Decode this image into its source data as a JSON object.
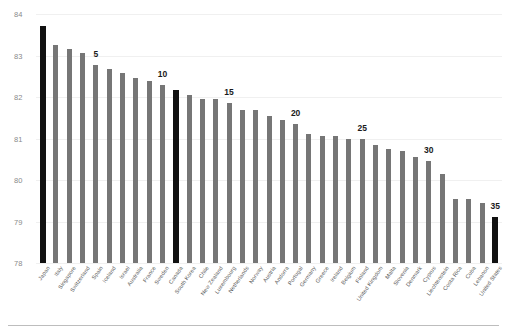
{
  "chart_data": {
    "type": "bar",
    "title": "",
    "subtitle": "",
    "xlabel": "",
    "ylabel": "",
    "ylim": [
      78,
      84
    ],
    "yticks": [
      78,
      79,
      80,
      81,
      82,
      83,
      84
    ],
    "ytick_labels": [
      "78",
      "79",
      "80",
      "81",
      "82",
      "83",
      "84"
    ],
    "grid": true,
    "legend": "none",
    "categories": [
      "Japan",
      "Italy",
      "Singapore",
      "Switzerland",
      "Spain",
      "Iceland",
      "Israel",
      "Australia",
      "France",
      "Sweden",
      "Canada",
      "South Korea",
      "Chile",
      "New Zealand",
      "Luxembourg",
      "Netherlands",
      "Norway",
      "Austria",
      "Andorra",
      "Portugal",
      "Germany",
      "Greece",
      "Ireland",
      "Belgium",
      "Finland",
      "United Kingdom",
      "Malta",
      "Slovenia",
      "Denmark",
      "Cyprus",
      "Liechtenstein",
      "Costa Rica",
      "Cuba",
      "Lebanon",
      "United States"
    ],
    "values": [
      83.7,
      83.25,
      83.15,
      83.05,
      82.77,
      82.67,
      82.58,
      82.47,
      82.38,
      82.28,
      82.17,
      82.05,
      81.95,
      81.95,
      81.85,
      81.68,
      81.68,
      81.55,
      81.45,
      81.35,
      81.1,
      81.05,
      81.05,
      81.0,
      81.0,
      80.85,
      80.75,
      80.7,
      80.55,
      80.45,
      80.15,
      79.55,
      79.55,
      79.45,
      79.1
    ],
    "highlighted": [
      "Japan",
      "Canada",
      "United States"
    ],
    "colors": {
      "bar": "#767676",
      "bar_highlight": "#111111",
      "background": "#ffffff",
      "gridline": "#f0f0f0",
      "tick_text": "#8a8a8a",
      "category_text": "#5b5b5b",
      "rank_text": "#1a1a1a",
      "footer_rule": "#bdbdbd"
    },
    "rank_callouts": [
      {
        "label": "5",
        "category": "Spain"
      },
      {
        "label": "10",
        "category": "Sweden"
      },
      {
        "label": "15",
        "category": "Luxembourg"
      },
      {
        "label": "20",
        "category": "Portugal"
      },
      {
        "label": "25",
        "category": "Finland"
      },
      {
        "label": "30",
        "category": "Cyprus"
      },
      {
        "label": "35",
        "category": "United States"
      }
    ]
  }
}
